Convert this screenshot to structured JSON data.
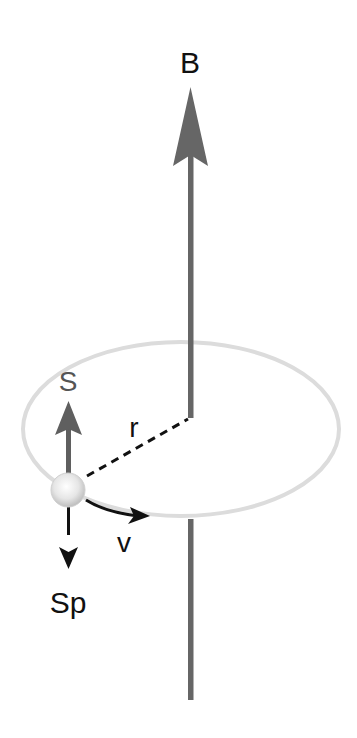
{
  "diagram": {
    "labels": {
      "B": "B",
      "S": "S",
      "r": "r",
      "v": "v",
      "Sp": "Sp"
    },
    "colors": {
      "field_arrow": "#666666",
      "spin_arrow": "#5f5f5f",
      "orbit": "#dcdcdc",
      "black": "#111111",
      "particle": "#e8e8e8"
    },
    "elements": [
      {
        "id": "B",
        "kind": "magnetic field vector",
        "direction": "up"
      },
      {
        "id": "orbit",
        "kind": "circular orbit (ellipse in perspective)"
      },
      {
        "id": "particle",
        "kind": "sphere on orbit"
      },
      {
        "id": "S",
        "kind": "spin vector",
        "direction": "up"
      },
      {
        "id": "Sp",
        "kind": "precessing spin component",
        "direction": "down"
      },
      {
        "id": "r",
        "kind": "radius (dashed line)"
      },
      {
        "id": "v",
        "kind": "velocity (curved arrow)"
      }
    ]
  }
}
